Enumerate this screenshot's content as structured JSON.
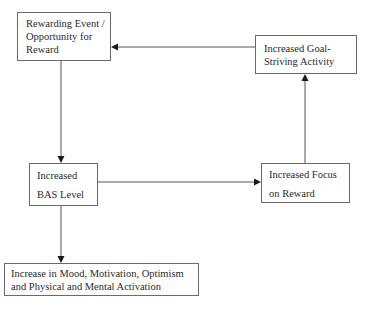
{
  "diagram": {
    "nodes": [
      {
        "id": "rewarding_event",
        "lines": [
          "Rewarding Event /",
          "Opportunity for",
          "Reward"
        ]
      },
      {
        "id": "goal_striving",
        "lines": [
          "Increased Goal-",
          "Striving Activity"
        ]
      },
      {
        "id": "bas_level",
        "lines": [
          "Increased",
          "BAS Level"
        ]
      },
      {
        "id": "focus_on_reward",
        "lines": [
          "Increased Focus",
          "on Reward"
        ]
      },
      {
        "id": "mood_activation",
        "lines": [
          "Increase in Mood, Motivation, Optimism",
          "and Physical and Mental Activation"
        ]
      }
    ],
    "edges": [
      {
        "from": "goal_striving",
        "to": "rewarding_event"
      },
      {
        "from": "rewarding_event",
        "to": "bas_level"
      },
      {
        "from": "bas_level",
        "to": "focus_on_reward"
      },
      {
        "from": "focus_on_reward",
        "to": "goal_striving"
      },
      {
        "from": "bas_level",
        "to": "mood_activation"
      }
    ],
    "colors": {
      "box_border": "#6a6a6a",
      "line": "#555555",
      "arrowhead": "#1a1a1a",
      "text": "#2a2a2a",
      "background": "#ffffff"
    }
  }
}
